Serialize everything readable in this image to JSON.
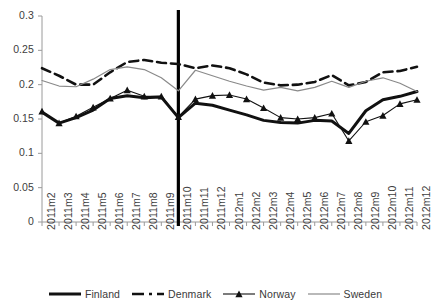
{
  "chart_data": {
    "type": "line",
    "title": "",
    "xlabel": "",
    "ylabel": "",
    "ylim": [
      0,
      0.3
    ],
    "ytick_values": [
      0,
      0.05,
      0.1,
      0.15,
      0.2,
      0.25,
      0.3
    ],
    "ytick_labels": [
      "0",
      "0.05",
      "0.1",
      "0.15",
      "0.2",
      "0.25",
      "0.3"
    ],
    "grid": false,
    "legend_position": "bottom",
    "categories": [
      "2011m2",
      "2011m3",
      "2011m4",
      "2011m5",
      "2011m6",
      "2011m7",
      "2011m8",
      "2011m9",
      "2011m10",
      "2011m11",
      "2011m12",
      "2012m1",
      "2012m2",
      "2012m3",
      "2012m4",
      "2012m5",
      "2012m6",
      "2012m7",
      "2012m8",
      "2012m9",
      "2012m10",
      "2012m11",
      "2012m12"
    ],
    "annotations": [
      {
        "type": "vline",
        "at_category": "2011m10",
        "label": ""
      }
    ],
    "series": [
      {
        "name": "Finland",
        "style": "solid-thick",
        "marker": "none",
        "color": "#111111",
        "values": [
          0.16,
          0.144,
          0.152,
          0.163,
          0.18,
          0.184,
          0.181,
          0.182,
          0.152,
          0.173,
          0.17,
          0.163,
          0.156,
          0.148,
          0.145,
          0.144,
          0.148,
          0.147,
          0.129,
          0.162,
          0.178,
          0.183,
          0.19
        ]
      },
      {
        "name": "Denmark",
        "style": "dashed",
        "marker": "none",
        "color": "#111111",
        "values": [
          0.224,
          0.213,
          0.2,
          0.2,
          0.218,
          0.233,
          0.236,
          0.232,
          0.23,
          0.224,
          0.228,
          0.224,
          0.215,
          0.203,
          0.199,
          0.2,
          0.204,
          0.214,
          0.199,
          0.204,
          0.218,
          0.22,
          0.226
        ]
      },
      {
        "name": "Norway",
        "style": "solid-thin",
        "marker": "triangle",
        "color": "#111111",
        "values": [
          0.161,
          0.144,
          0.154,
          0.167,
          0.18,
          0.192,
          0.183,
          0.183,
          0.153,
          0.179,
          0.184,
          0.185,
          0.179,
          0.166,
          0.152,
          0.15,
          0.152,
          0.158,
          0.118,
          0.146,
          0.155,
          0.172,
          0.178
        ]
      },
      {
        "name": "Sweden",
        "style": "solid-gray",
        "marker": "none",
        "color": "#8a8a8a",
        "values": [
          0.206,
          0.198,
          0.197,
          0.208,
          0.222,
          0.226,
          0.222,
          0.21,
          0.191,
          0.221,
          0.213,
          0.205,
          0.198,
          0.192,
          0.196,
          0.191,
          0.196,
          0.205,
          0.196,
          0.205,
          0.21,
          0.202,
          0.19
        ]
      }
    ]
  },
  "legend": {
    "items": [
      {
        "label": "Finland",
        "key": "solid-thick"
      },
      {
        "label": "Denmark",
        "key": "dashed"
      },
      {
        "label": "Norway",
        "key": "triangle-line"
      },
      {
        "label": "Sweden",
        "key": "solid-gray"
      }
    ]
  }
}
